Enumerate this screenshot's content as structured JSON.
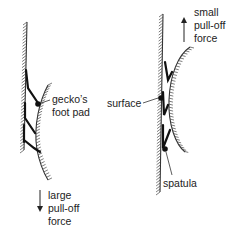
{
  "figures": [
    {
      "id": "left",
      "labels": {
        "pad": [
          "gecko’s",
          "foot pad"
        ],
        "force": [
          "large",
          "pull-off",
          "force"
        ]
      },
      "force_direction": "down"
    },
    {
      "id": "right",
      "labels": {
        "surface": "surface",
        "spatula": "spatula",
        "force": [
          "small",
          "pull-off",
          "force"
        ]
      },
      "force_direction": "up"
    }
  ],
  "colors": {
    "ink": "#222222",
    "background": "#ffffff"
  }
}
